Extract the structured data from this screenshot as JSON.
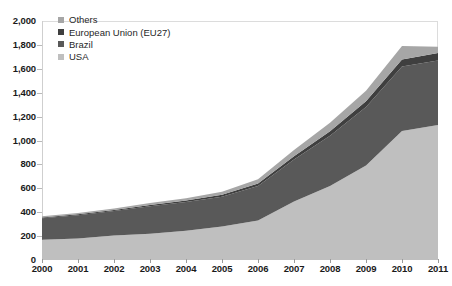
{
  "chart_data": {
    "type": "area",
    "title": "",
    "subtitle": "",
    "xlabel": "",
    "ylabel": "",
    "stacked": true,
    "grid": false,
    "legend_position": "top-left-inside",
    "xlim": [
      2000,
      2011
    ],
    "ylim": [
      0,
      2000
    ],
    "ytick_step": 200,
    "categories": [
      "2000",
      "2001",
      "2002",
      "2003",
      "2004",
      "2005",
      "2006",
      "2007",
      "2008",
      "2009",
      "2010",
      "2011"
    ],
    "x": [
      2000,
      2001,
      2002,
      2003,
      2004,
      2005,
      2006,
      2007,
      2008,
      2009,
      2010,
      2011
    ],
    "ytick_labels": [
      "2,000",
      "1,800",
      "1,600",
      "1,400",
      "1,200",
      "1,000",
      "800",
      "600",
      "400",
      "200",
      "0"
    ],
    "ytick_values": [
      2000,
      1800,
      1600,
      1400,
      1200,
      1000,
      800,
      600,
      400,
      200,
      0
    ],
    "series": [
      {
        "name": "USA",
        "color": "#bfbfbf",
        "values": [
          170,
          180,
          205,
          220,
          245,
          280,
          330,
          490,
          620,
          790,
          1080,
          1130
        ]
      },
      {
        "name": "Brazil",
        "color": "#595959",
        "values": [
          180,
          195,
          205,
          230,
          240,
          250,
          290,
          350,
          420,
          490,
          540,
          540
        ]
      },
      {
        "name": "European Union (EU27)",
        "color": "#3f3f3f",
        "values": [
          6,
          7,
          8,
          10,
          12,
          15,
          20,
          28,
          38,
          48,
          58,
          62
        ]
      },
      {
        "name": "Others",
        "color": "#a6a6a6",
        "values": [
          10,
          12,
          14,
          16,
          20,
          26,
          36,
          52,
          70,
          88,
          112,
          52
        ]
      }
    ],
    "totals": [
      366,
      394,
      432,
      476,
      517,
      571,
      676,
      920,
      1148,
      1416,
      1790,
      1784
    ]
  },
  "legend": {
    "items": [
      {
        "label": "Others",
        "color": "#a6a6a6"
      },
      {
        "label": "European Union (EU27)",
        "color": "#3f3f3f"
      },
      {
        "label": "Brazil",
        "color": "#595959"
      },
      {
        "label": "USA",
        "color": "#bfbfbf"
      }
    ]
  },
  "axes": {
    "y_labels": [
      "2,000",
      "1,800",
      "1,600",
      "1,400",
      "1,200",
      "1,000",
      "800",
      "600",
      "400",
      "200",
      "0"
    ],
    "x_labels": [
      "2000",
      "2001",
      "2002",
      "2003",
      "2004",
      "2005",
      "2006",
      "2007",
      "2008",
      "2009",
      "2010",
      "2011"
    ]
  }
}
